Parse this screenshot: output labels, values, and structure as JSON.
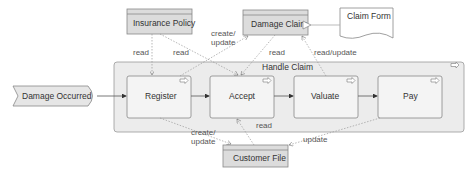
{
  "diagram": {
    "event": {
      "label": "Damage Occurred"
    },
    "process_group": {
      "label": "Handle Claim"
    },
    "activities": [
      {
        "label": "Register"
      },
      {
        "label": "Accept"
      },
      {
        "label": "Valuate"
      },
      {
        "label": "Pay"
      }
    ],
    "data_objects": {
      "insurance_policy": "Insurance Policy",
      "damage_claim": "Damage Claim",
      "customer_file": "Customer File"
    },
    "document": {
      "label": "Claim Form"
    },
    "edge_labels": {
      "policy_register": "read",
      "policy_accept": "read",
      "accept_claim": "create/\nupdate",
      "claim_accept": "read",
      "valuate_claim": "read/update",
      "register_file": "create/\nupdate",
      "file_accept": "read",
      "pay_file": "update"
    }
  },
  "colors": {
    "box_fill": "#f4f4f4",
    "data_fill": "#dcdcdc",
    "stroke": "#888888",
    "group_fill": "#ececec"
  }
}
